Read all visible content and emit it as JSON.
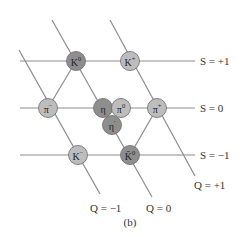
{
  "figure": {
    "caption": "(b)",
    "colors": {
      "line": "#8c8c8c",
      "dark_fill": "#8e8e8e",
      "light_fill": "#bdbdbd",
      "stroke": "#6a6a6a",
      "text": "#333333"
    }
  },
  "strangeness_labels": [
    {
      "text": "S = +1",
      "y": 61
    },
    {
      "text": "S = 0",
      "y": 108
    },
    {
      "text": "S = −1",
      "y": 155
    }
  ],
  "charge_labels": [
    {
      "text": "Q = −1",
      "x": 100,
      "y": 208
    },
    {
      "text": "Q = 0",
      "x": 152,
      "y": 208
    },
    {
      "text": "Q = +1",
      "x": 193,
      "y": 185
    }
  ],
  "particles": [
    {
      "id": "K0",
      "base": "K",
      "sup": "0",
      "x": 76,
      "y": 61,
      "shade": "dark"
    },
    {
      "id": "Kplus",
      "base": "K",
      "sup": "+",
      "x": 130,
      "y": 61,
      "shade": "light"
    },
    {
      "id": "piminus",
      "base": "π",
      "sup": "−",
      "x": 48,
      "y": 108,
      "shade": "light"
    },
    {
      "id": "eta",
      "base": "η",
      "sup": "",
      "x": 103,
      "y": 108,
      "shade": "dark"
    },
    {
      "id": "pi0",
      "base": "π",
      "sup": "0",
      "x": 121,
      "y": 108,
      "shade": "light"
    },
    {
      "id": "piplus",
      "base": "π",
      "sup": "+",
      "x": 157,
      "y": 108,
      "shade": "light"
    },
    {
      "id": "etaprime",
      "base": "η",
      "sup": "′",
      "x": 112,
      "y": 125,
      "shade": "dark"
    },
    {
      "id": "Kminus",
      "base": "K",
      "sup": "−",
      "x": 78,
      "y": 155,
      "shade": "light"
    },
    {
      "id": "K0bar",
      "base": "K̄",
      "sup": "0",
      "x": 130,
      "y": 155,
      "shade": "dark"
    }
  ]
}
